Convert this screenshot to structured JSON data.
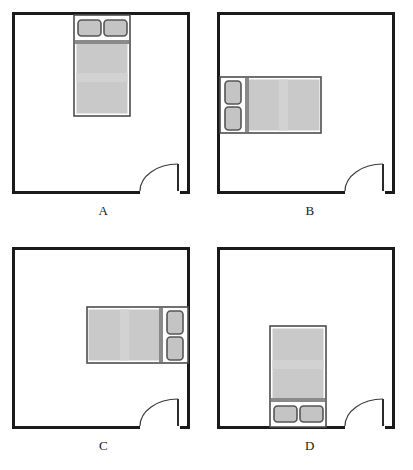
{
  "figure": {
    "type": "floor-plan-diagram",
    "panel_count": 4,
    "background_color": "#ffffff"
  },
  "style": {
    "wall_color": "#1a1a1a",
    "wall_thickness_px": 3,
    "room_fill": "#ffffff",
    "bed_frame_color": "#ffffff",
    "bed_outline_color": "#4d4d4d",
    "mattress_color": "#c9c9c9",
    "mattress_band_color": "#d4d4d4",
    "headboard_band_color": "#8a8a8a",
    "pillow_fill": "#c4c4c4",
    "pillow_outline": "#555555",
    "door_line_color": "#3a3a3a",
    "label_color": "#1a1a1a"
  },
  "panels": [
    {
      "id": "A",
      "label": "A",
      "bed_wall": "top",
      "bed_orientation": "vertical",
      "pillow_side": "top",
      "pillow_count": 2,
      "door_wall": "bottom-right",
      "door_swing": "quarter-arc",
      "room_size_px": {
        "width": 176,
        "height": 181
      }
    },
    {
      "id": "B",
      "label": "B",
      "bed_wall": "left",
      "bed_orientation": "horizontal",
      "pillow_side": "left",
      "pillow_count": 2,
      "door_wall": "bottom-right",
      "door_swing": "quarter-arc",
      "room_size_px": {
        "width": 176,
        "height": 181
      }
    },
    {
      "id": "C",
      "label": "C",
      "bed_wall": "right",
      "bed_orientation": "horizontal",
      "pillow_side": "right",
      "pillow_count": 2,
      "door_wall": "bottom-right",
      "door_swing": "quarter-arc",
      "room_size_px": {
        "width": 176,
        "height": 181
      }
    },
    {
      "id": "D",
      "label": "D",
      "bed_wall": "bottom",
      "bed_orientation": "vertical",
      "pillow_side": "bottom",
      "pillow_count": 2,
      "door_wall": "bottom-right",
      "door_swing": "quarter-arc",
      "room_size_px": {
        "width": 176,
        "height": 181
      }
    }
  ]
}
